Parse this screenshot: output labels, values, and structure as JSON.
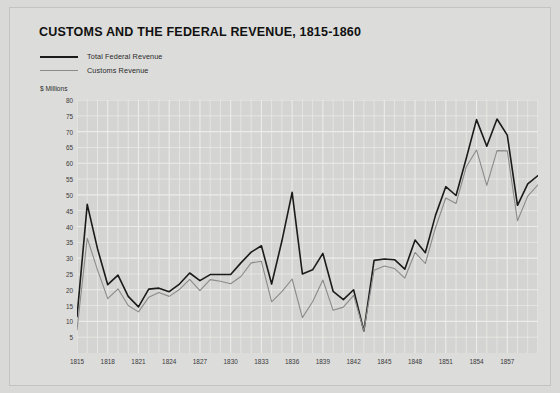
{
  "title": "CUSTOMS AND THE FEDERAL REVENUE, 1815-1860",
  "unit_label": "$ Millions",
  "legend": {
    "total": "Total Federal Revenue",
    "customs": "Customs Revenue"
  },
  "colors": {
    "page_background": "#d9d9d7",
    "card_background": "#dcdcda",
    "plot_background": "#d4d4d2",
    "gridline": "#ececea",
    "total_line": "#1b1b1b",
    "customs_line": "#8b8b8b",
    "text": "#1a1a1a"
  },
  "chart_data": {
    "type": "line",
    "title": "CUSTOMS AND THE FEDERAL REVENUE, 1815-1860",
    "xlabel": "",
    "ylabel": "$ Millions",
    "ylim": [
      0,
      80
    ],
    "xlim": [
      1815,
      1860
    ],
    "grid": true,
    "legend_position": "top-left",
    "ytick_values": [
      5,
      10,
      15,
      20,
      25,
      30,
      35,
      40,
      45,
      50,
      55,
      60,
      65,
      70,
      75,
      80
    ],
    "xtick_labels": [
      "1815",
      "1818",
      "1821",
      "1824",
      "1827",
      "1830",
      "1833",
      "1836",
      "1839",
      "1842",
      "1845",
      "1848",
      "1851",
      "1854",
      "1857"
    ],
    "x": [
      1815,
      1816,
      1817,
      1818,
      1819,
      1820,
      1821,
      1822,
      1823,
      1824,
      1825,
      1826,
      1827,
      1828,
      1829,
      1830,
      1831,
      1832,
      1833,
      1834,
      1835,
      1836,
      1837,
      1838,
      1839,
      1840,
      1841,
      1842,
      1843,
      1844,
      1845,
      1846,
      1847,
      1848,
      1849,
      1850,
      1851,
      1852,
      1853,
      1854,
      1855,
      1856,
      1857,
      1858,
      1859,
      1860
    ],
    "series": [
      {
        "name": "Total Federal Revenue",
        "color": "#1b1b1b",
        "values": [
          11.5,
          47.0,
          33.0,
          21.6,
          24.6,
          17.9,
          14.6,
          20.2,
          20.5,
          19.4,
          21.8,
          25.3,
          22.9,
          24.8,
          24.8,
          24.8,
          28.5,
          31.9,
          33.9,
          21.8,
          35.4,
          50.8,
          25.0,
          26.3,
          31.5,
          19.5,
          16.9,
          20.0,
          7.0,
          29.3,
          29.7,
          29.5,
          26.5,
          35.7,
          31.7,
          43.6,
          52.6,
          49.8,
          61.6,
          73.8,
          65.4,
          74.0,
          68.9,
          46.7,
          53.5,
          56.1
        ]
      },
      {
        "name": "Customs Revenue",
        "color": "#8b8b8b",
        "values": [
          7.3,
          36.3,
          26.3,
          17.2,
          20.3,
          15.0,
          13.0,
          17.6,
          19.1,
          17.9,
          20.1,
          23.3,
          19.7,
          23.2,
          22.7,
          21.9,
          24.2,
          28.5,
          29.0,
          16.2,
          19.4,
          23.4,
          11.2,
          16.2,
          23.1,
          13.5,
          14.5,
          18.2,
          7.0,
          26.2,
          27.5,
          26.7,
          23.7,
          31.8,
          28.3,
          39.7,
          49.0,
          47.3,
          58.9,
          64.2,
          53.0,
          64.0,
          63.9,
          41.8,
          49.6,
          53.2
        ]
      }
    ]
  }
}
